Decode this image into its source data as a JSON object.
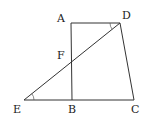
{
  "diagram": {
    "type": "geometry",
    "points": {
      "A": {
        "label": "A",
        "x": 71,
        "y": 23
      },
      "D": {
        "label": "D",
        "x": 120,
        "y": 23
      },
      "B": {
        "label": "B",
        "x": 72,
        "y": 100
      },
      "C": {
        "label": "C",
        "x": 134,
        "y": 100
      },
      "E": {
        "label": "E",
        "x": 24,
        "y": 100
      },
      "F": {
        "label": "F",
        "x": 71.5,
        "y": 62
      }
    },
    "segments": [
      [
        "A",
        "D"
      ],
      [
        "A",
        "B"
      ],
      [
        "D",
        "C"
      ],
      [
        "E",
        "C"
      ],
      [
        "E",
        "D"
      ]
    ],
    "angle_marks": [
      "E",
      "D"
    ],
    "labels": {
      "A": "A",
      "B": "B",
      "C": "C",
      "D": "D",
      "E": "E",
      "F": "F"
    }
  }
}
